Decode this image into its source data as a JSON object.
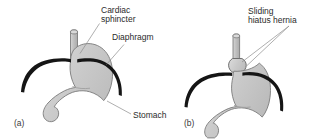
{
  "figure": {
    "width": 317,
    "height": 139,
    "background": "#ffffff",
    "panels": [
      {
        "id": "a",
        "panel_label": "(a)",
        "description": "Normal stomach position with cardiac sphincter below the diaphragm",
        "labels": [
          {
            "name": "cardiac-sphincter",
            "line1": "Cardiac",
            "line2": "sphincter"
          },
          {
            "name": "diaphragm",
            "line1": "Diaphragm",
            "line2": ""
          },
          {
            "name": "stomach",
            "line1": "Stomach",
            "line2": ""
          }
        ]
      },
      {
        "id": "b",
        "panel_label": "(b)",
        "description": "Sliding hiatus hernia with upper stomach pushed above the diaphragm",
        "labels": [
          {
            "name": "sliding-hiatus-hernia",
            "line1": "Sliding",
            "line2": "hiatus hernia"
          }
        ]
      }
    ]
  },
  "text": {
    "cardiac_sphincter_l1": "Cardiac",
    "cardiac_sphincter_l2": "sphincter",
    "diaphragm": "Diaphragm",
    "stomach": "Stomach",
    "hernia_l1": "Sliding",
    "hernia_l2": "hiatus hernia",
    "panel_a": "(a)",
    "panel_b": "(b)"
  },
  "colors": {
    "background": "#ffffff",
    "organ_fill": "#c9c9c9",
    "organ_fill_light": "#d8d8d8",
    "organ_outline": "#6e6e6e",
    "diaphragm": "#1a1a1a",
    "esophagus_fill": "#bdbdbd",
    "leader_line": "#8d8d8d",
    "text": "#2b2b2b"
  }
}
